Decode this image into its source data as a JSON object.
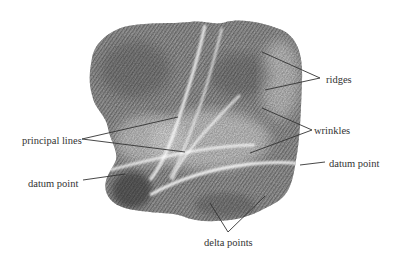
{
  "figure": {
    "colors": {
      "background": "#ffffff",
      "ink_dark": "#4a4a4a",
      "ink_mid": "#8a8a8a",
      "ink_light": "#c4c4c4",
      "leader_line": "#333333",
      "label_text": "#333333"
    }
  },
  "labels": {
    "ridges": "ridges",
    "wrinkles": "wrinkles",
    "datum_point_right": "datum point",
    "principal_lines": "principal lines",
    "datum_point_left": "datum point",
    "delta_points": "delta points"
  }
}
